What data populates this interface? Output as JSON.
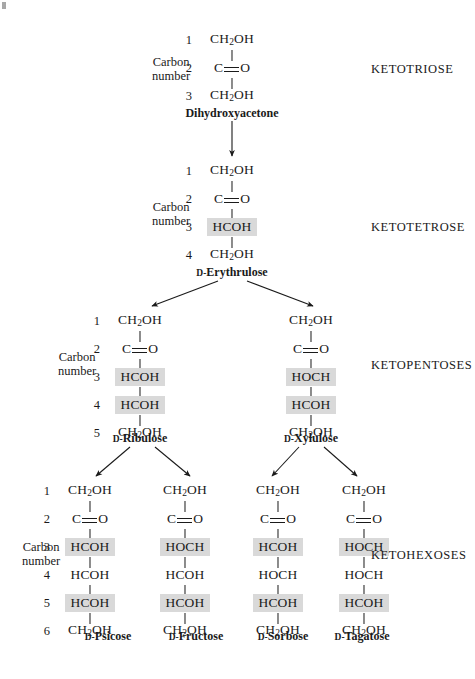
{
  "figure": {
    "carbon_number_label_line1": "Carbon",
    "carbon_number_label_line2": "number",
    "highlight_color": "#d9d9d9",
    "stroke_color": "#1a1a1a"
  },
  "class_labels": {
    "ketotriose": "KETOTRIOSE",
    "ketotetrose": "KETOTETROSE",
    "ketopentoses": "KETOPENTOSES",
    "ketohexoses": "KETOHEXOSES"
  },
  "groups": {
    "ch2oh": "CH₂OH",
    "co": "C=O",
    "hcoh": "HCOH",
    "hoch": "HOCH"
  },
  "molecules": [
    {
      "id": "dihydroxyacetone",
      "name": "Dihydroxyacetone",
      "name_prefix": "",
      "carbon_count": 3,
      "numbers": [
        "1",
        "2",
        "3"
      ],
      "rows": [
        {
          "group": "CH₂OH",
          "highlight": false,
          "type": "ch2oh"
        },
        {
          "group": "C=O",
          "highlight": false,
          "type": "co"
        },
        {
          "group": "CH₂OH",
          "highlight": false,
          "type": "ch2oh"
        }
      ]
    },
    {
      "id": "d-erythrulose",
      "name": "Erythrulose",
      "name_prefix": "D-",
      "carbon_count": 4,
      "numbers": [
        "1",
        "2",
        "3",
        "4"
      ],
      "rows": [
        {
          "group": "CH₂OH",
          "highlight": false,
          "type": "ch2oh"
        },
        {
          "group": "C=O",
          "highlight": false,
          "type": "co"
        },
        {
          "group": "HCOH",
          "highlight": true,
          "type": "hcoh"
        },
        {
          "group": "CH₂OH",
          "highlight": false,
          "type": "ch2oh"
        }
      ]
    },
    {
      "id": "d-ribulose",
      "name": "Ribulose",
      "name_prefix": "D-",
      "carbon_count": 5,
      "numbers": [
        "1",
        "2",
        "3",
        "4",
        "5"
      ],
      "rows": [
        {
          "group": "CH₂OH",
          "highlight": false,
          "type": "ch2oh"
        },
        {
          "group": "C=O",
          "highlight": false,
          "type": "co"
        },
        {
          "group": "HCOH",
          "highlight": true,
          "type": "hcoh"
        },
        {
          "group": "HCOH",
          "highlight": true,
          "type": "hcoh"
        },
        {
          "group": "CH₂OH",
          "highlight": false,
          "type": "ch2oh"
        }
      ]
    },
    {
      "id": "d-xylulose",
      "name": "Xylulose",
      "name_prefix": "D-",
      "carbon_count": 5,
      "numbers": [
        "1",
        "2",
        "3",
        "4",
        "5"
      ],
      "rows": [
        {
          "group": "CH₂OH",
          "highlight": false,
          "type": "ch2oh"
        },
        {
          "group": "C=O",
          "highlight": false,
          "type": "co"
        },
        {
          "group": "HOCH",
          "highlight": true,
          "type": "hoch"
        },
        {
          "group": "HCOH",
          "highlight": true,
          "type": "hcoh"
        },
        {
          "group": "CH₂OH",
          "highlight": false,
          "type": "ch2oh"
        }
      ]
    },
    {
      "id": "d-psicose",
      "name": "Psicose",
      "name_prefix": "D-",
      "carbon_count": 6,
      "numbers": [
        "1",
        "2",
        "3",
        "4",
        "5",
        "6"
      ],
      "rows": [
        {
          "group": "CH₂OH",
          "highlight": false,
          "type": "ch2oh"
        },
        {
          "group": "C=O",
          "highlight": false,
          "type": "co"
        },
        {
          "group": "HCOH",
          "highlight": true,
          "type": "hcoh"
        },
        {
          "group": "HCOH",
          "highlight": false,
          "type": "hcoh"
        },
        {
          "group": "HCOH",
          "highlight": true,
          "type": "hcoh"
        },
        {
          "group": "CH₂OH",
          "highlight": false,
          "type": "ch2oh"
        }
      ]
    },
    {
      "id": "d-fructose",
      "name": "Fructose",
      "name_prefix": "D-",
      "carbon_count": 6,
      "numbers": [
        "1",
        "2",
        "3",
        "4",
        "5",
        "6"
      ],
      "rows": [
        {
          "group": "CH₂OH",
          "highlight": false,
          "type": "ch2oh"
        },
        {
          "group": "C=O",
          "highlight": false,
          "type": "co"
        },
        {
          "group": "HOCH",
          "highlight": true,
          "type": "hoch"
        },
        {
          "group": "HCOH",
          "highlight": false,
          "type": "hcoh"
        },
        {
          "group": "HCOH",
          "highlight": true,
          "type": "hcoh"
        },
        {
          "group": "CH₂OH",
          "highlight": false,
          "type": "ch2oh"
        }
      ]
    },
    {
      "id": "d-sorbose",
      "name": "Sorbose",
      "name_prefix": "D-",
      "carbon_count": 6,
      "numbers": [
        "1",
        "2",
        "3",
        "4",
        "5",
        "6"
      ],
      "rows": [
        {
          "group": "CH₂OH",
          "highlight": false,
          "type": "ch2oh"
        },
        {
          "group": "C=O",
          "highlight": false,
          "type": "co"
        },
        {
          "group": "HCOH",
          "highlight": true,
          "type": "hcoh"
        },
        {
          "group": "HOCH",
          "highlight": false,
          "type": "hoch"
        },
        {
          "group": "HCOH",
          "highlight": true,
          "type": "hcoh"
        },
        {
          "group": "CH₂OH",
          "highlight": false,
          "type": "ch2oh"
        }
      ]
    },
    {
      "id": "d-tagatose",
      "name": "Tagatose",
      "name_prefix": "D-",
      "carbon_count": 6,
      "numbers": [
        "1",
        "2",
        "3",
        "4",
        "5",
        "6"
      ],
      "rows": [
        {
          "group": "CH₂OH",
          "highlight": false,
          "type": "ch2oh"
        },
        {
          "group": "C=O",
          "highlight": false,
          "type": "co"
        },
        {
          "group": "HOCH",
          "highlight": true,
          "type": "hoch"
        },
        {
          "group": "HOCH",
          "highlight": false,
          "type": "hoch"
        },
        {
          "group": "HCOH",
          "highlight": true,
          "type": "hcoh"
        },
        {
          "group": "CH₂OH",
          "highlight": false,
          "type": "ch2oh"
        }
      ]
    }
  ]
}
